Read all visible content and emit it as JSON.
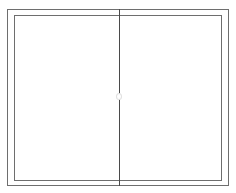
{
  "diagram": {
    "type": "sliding-window-elevation",
    "panels": 2,
    "stroke_color": "#6e6e6e",
    "divider_color": "#4a4a4a",
    "background": "#ffffff"
  }
}
